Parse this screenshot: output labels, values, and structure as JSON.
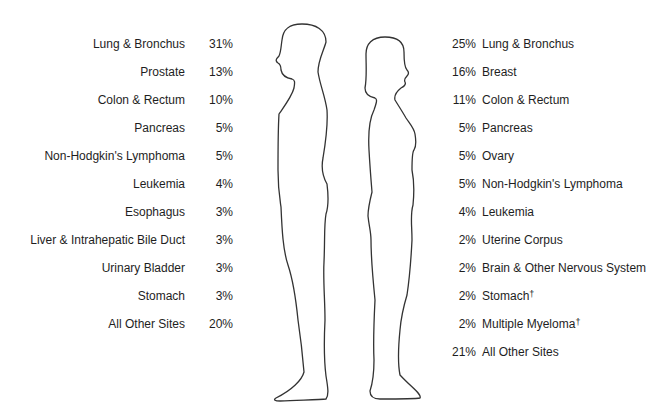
{
  "male": {
    "sites": [
      {
        "label": "Lung & Bronchus",
        "pct": "31%"
      },
      {
        "label": "Prostate",
        "pct": "13%"
      },
      {
        "label": "Colon & Rectum",
        "pct": "10%"
      },
      {
        "label": "Pancreas",
        "pct": "5%"
      },
      {
        "label": "Non-Hodgkin's Lymphoma",
        "pct": "5%"
      },
      {
        "label": "Leukemia",
        "pct": "4%"
      },
      {
        "label": "Esophagus",
        "pct": "3%"
      },
      {
        "label": "Liver & Intrahepatic Bile Duct",
        "pct": "3%"
      },
      {
        "label": "Urinary Bladder",
        "pct": "3%"
      },
      {
        "label": "Stomach",
        "pct": "3%"
      },
      {
        "label": "All Other Sites",
        "pct": "20%"
      }
    ]
  },
  "female": {
    "sites": [
      {
        "label": "Lung & Bronchus",
        "pct": "25%",
        "mark": ""
      },
      {
        "label": "Breast",
        "pct": "16%",
        "mark": ""
      },
      {
        "label": "Colon & Rectum",
        "pct": "11%",
        "mark": ""
      },
      {
        "label": "Pancreas",
        "pct": "5%",
        "mark": ""
      },
      {
        "label": "Ovary",
        "pct": "5%",
        "mark": ""
      },
      {
        "label": "Non-Hodgkin's Lymphoma",
        "pct": "5%",
        "mark": ""
      },
      {
        "label": "Leukemia",
        "pct": "4%",
        "mark": ""
      },
      {
        "label": "Uterine Corpus",
        "pct": "2%",
        "mark": ""
      },
      {
        "label": "Brain & Other Nervous System",
        "pct": "2%",
        "mark": ""
      },
      {
        "label": "Stomach",
        "pct": "2%",
        "mark": "†"
      },
      {
        "label": "Multiple Myeloma",
        "pct": "2%",
        "mark": "†"
      },
      {
        "label": "All Other Sites",
        "pct": "21%",
        "mark": ""
      }
    ]
  },
  "figures": {
    "male": "male-silhouette",
    "female": "female-silhouette"
  },
  "colors": {
    "line": "#333333",
    "text": "#1e1e1e",
    "background": "#ffffff"
  }
}
